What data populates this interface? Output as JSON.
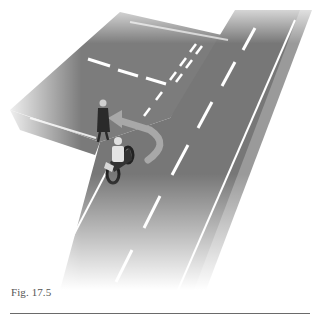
{
  "figure": {
    "caption": "Fig. 17.5",
    "scene": "Motorcyclist turning left into a side road while a pedestrian crosses the side road",
    "elements": [
      "main-road",
      "side-road",
      "lane-markings",
      "give-way-lines",
      "turn-arrow",
      "pedestrian",
      "motorcyclist"
    ]
  },
  "colors": {
    "road": "#7a7a7a",
    "road_dark": "#6e6e6e",
    "kerb": "#9a9a9a",
    "marking": "#ffffff",
    "arrow": "#a6a6a6",
    "background": "#ffffff",
    "rule": "#6a6a6a"
  }
}
